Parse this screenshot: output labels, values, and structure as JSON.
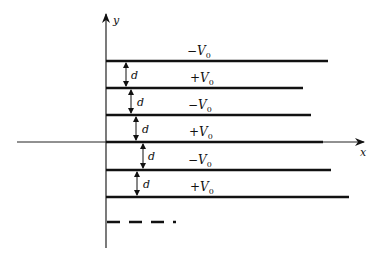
{
  "figure": {
    "axes": {
      "x_label": "x",
      "y_label": "y"
    },
    "plates": [
      {
        "potential_sign": "−",
        "potential_symbol": "V",
        "subscript": "0",
        "y": 61,
        "x_end": 328
      },
      {
        "potential_sign": "+",
        "potential_symbol": "V",
        "subscript": "0",
        "y": 88,
        "x_end": 303
      },
      {
        "potential_sign": "−",
        "potential_symbol": "V",
        "subscript": "0",
        "y": 115,
        "x_end": 311
      },
      {
        "potential_sign": "+",
        "potential_symbol": "V",
        "subscript": "0",
        "y": 142,
        "x_end": 323
      },
      {
        "potential_sign": "−",
        "potential_symbol": "V",
        "subscript": "0",
        "y": 170,
        "x_end": 331
      },
      {
        "potential_sign": "+",
        "potential_symbol": "V",
        "subscript": "0",
        "y": 197,
        "x_end": 349
      }
    ],
    "labels_between_plates": [
      {
        "text": "+V0",
        "sign": "+",
        "symbol": "V",
        "subscript": "0"
      },
      {
        "text": "−V0",
        "sign": "−",
        "symbol": "V",
        "subscript": "0"
      },
      {
        "text": "+V0",
        "sign": "+",
        "symbol": "V",
        "subscript": "0"
      },
      {
        "text": "−V0",
        "sign": "−",
        "symbol": "V",
        "subscript": "0"
      },
      {
        "text": "+V0",
        "sign": "+",
        "symbol": "V",
        "subscript": "0"
      }
    ],
    "top_label": {
      "sign": "−",
      "symbol": "V",
      "subscript": "0"
    },
    "spacing_label": "d",
    "continuation": "dashed line indicating more plates"
  }
}
